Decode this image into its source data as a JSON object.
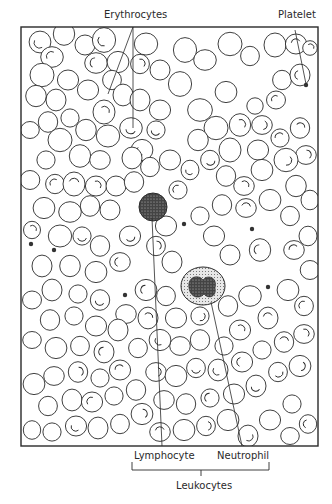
{
  "figure": {
    "type": "blood-smear-illustration",
    "labels": {
      "erythrocytes": "Erythrocytes",
      "platelet": "Platelet",
      "lymphocyte": "Lymphocyte",
      "neutrophil": "Neutrophil",
      "leukocytes": "Leukocytes"
    },
    "colors": {
      "ink": "#2a2a2a",
      "background": "#ffffff"
    },
    "frame": {
      "x": 21,
      "y": 27,
      "width": 297,
      "height": 419
    },
    "lymphocyte": {
      "cx": 153,
      "cy": 207,
      "r": 14
    },
    "neutrophil": {
      "cx": 203,
      "cy": 286,
      "rx": 22,
      "ry": 19
    },
    "platelets": [
      [
        306,
        85
      ],
      [
        268,
        287
      ],
      [
        125,
        295
      ],
      [
        184,
        224
      ],
      [
        31,
        244
      ],
      [
        54,
        250
      ],
      [
        252,
        229
      ]
    ],
    "rbcs": [
      [
        40,
        42,
        12,
        1
      ],
      [
        64,
        34,
        11,
        0
      ],
      [
        52,
        57,
        11,
        1
      ],
      [
        42,
        75,
        11,
        0
      ],
      [
        36,
        96,
        11,
        0
      ],
      [
        56,
        100,
        10,
        0
      ],
      [
        68,
        80,
        10,
        0
      ],
      [
        85,
        45,
        11,
        0
      ],
      [
        104,
        40,
        12,
        1
      ],
      [
        96,
        63,
        11,
        1
      ],
      [
        118,
        62,
        10,
        0
      ],
      [
        112,
        80,
        10,
        0
      ],
      [
        123,
        95,
        10,
        0
      ],
      [
        88,
        90,
        10,
        0
      ],
      [
        70,
        118,
        10,
        0
      ],
      [
        48,
        122,
        10,
        0
      ],
      [
        30,
        130,
        9,
        0
      ],
      [
        60,
        140,
        11,
        0
      ],
      [
        86,
        130,
        11,
        0
      ],
      [
        104,
        112,
        11,
        1
      ],
      [
        108,
        136,
        11,
        0
      ],
      [
        46,
        160,
        10,
        0
      ],
      [
        80,
        156,
        11,
        0
      ],
      [
        100,
        160,
        10,
        0
      ],
      [
        30,
        180,
        9,
        0
      ],
      [
        55,
        184,
        10,
        1
      ],
      [
        74,
        184,
        11,
        1
      ],
      [
        96,
        186,
        10,
        1
      ],
      [
        116,
        186,
        11,
        0
      ],
      [
        134,
        182,
        10,
        0
      ],
      [
        131,
        128,
        11,
        1
      ],
      [
        142,
        150,
        10,
        1
      ],
      [
        150,
        167,
        10,
        0
      ],
      [
        132,
        158,
        10,
        0
      ],
      [
        146,
        44,
        11,
        0
      ],
      [
        160,
        70,
        11,
        0
      ],
      [
        185,
        50,
        12,
        0
      ],
      [
        205,
        60,
        11,
        0
      ],
      [
        230,
        44,
        11,
        0
      ],
      [
        250,
        56,
        10,
        0
      ],
      [
        275,
        45,
        11,
        0
      ],
      [
        296,
        44,
        10,
        1
      ],
      [
        310,
        48,
        8,
        1
      ],
      [
        180,
        84,
        12,
        0
      ],
      [
        200,
        110,
        12,
        0
      ],
      [
        226,
        92,
        10,
        0
      ],
      [
        282,
        80,
        10,
        0
      ],
      [
        300,
        75,
        10,
        1
      ],
      [
        276,
        100,
        9,
        1
      ],
      [
        255,
        106,
        9,
        0
      ],
      [
        240,
        125,
        11,
        1
      ],
      [
        262,
        125,
        10,
        1
      ],
      [
        216,
        128,
        11,
        0
      ],
      [
        198,
        140,
        11,
        0
      ],
      [
        230,
        150,
        11,
        0
      ],
      [
        258,
        150,
        10,
        0
      ],
      [
        280,
        138,
        10,
        1
      ],
      [
        300,
        128,
        10,
        1
      ],
      [
        306,
        155,
        10,
        1
      ],
      [
        286,
        160,
        11,
        1
      ],
      [
        210,
        160,
        10,
        1
      ],
      [
        190,
        170,
        9,
        1
      ],
      [
        170,
        160,
        10,
        0
      ],
      [
        178,
        190,
        10,
        1
      ],
      [
        226,
        176,
        10,
        0
      ],
      [
        244,
        186,
        10,
        1
      ],
      [
        262,
        170,
        10,
        0
      ],
      [
        296,
        186,
        11,
        0
      ],
      [
        310,
        200,
        9,
        0
      ],
      [
        166,
        226,
        10,
        0
      ],
      [
        200,
        216,
        10,
        0
      ],
      [
        222,
        205,
        10,
        0
      ],
      [
        246,
        208,
        10,
        1
      ],
      [
        270,
        200,
        10,
        0
      ],
      [
        290,
        216,
        10,
        0
      ],
      [
        308,
        236,
        9,
        0
      ],
      [
        214,
        236,
        10,
        0
      ],
      [
        230,
        255,
        11,
        0
      ],
      [
        260,
        250,
        11,
        1
      ],
      [
        294,
        250,
        10,
        1
      ],
      [
        310,
        270,
        9,
        0
      ],
      [
        156,
        246,
        10,
        1
      ],
      [
        172,
        262,
        10,
        0
      ],
      [
        130,
        236,
        10,
        1
      ],
      [
        110,
        210,
        11,
        0
      ],
      [
        90,
        206,
        10,
        0
      ],
      [
        70,
        212,
        11,
        0
      ],
      [
        44,
        208,
        10,
        0
      ],
      [
        32,
        230,
        9,
        1
      ],
      [
        42,
        266,
        10,
        0
      ],
      [
        60,
        236,
        11,
        0
      ],
      [
        82,
        236,
        10,
        1
      ],
      [
        100,
        246,
        10,
        0
      ],
      [
        120,
        262,
        10,
        1
      ],
      [
        96,
        272,
        10,
        0
      ],
      [
        70,
        266,
        11,
        0
      ],
      [
        52,
        290,
        10,
        0
      ],
      [
        32,
        300,
        9,
        0
      ],
      [
        78,
        294,
        10,
        0
      ],
      [
        100,
        300,
        10,
        1
      ],
      [
        126,
        314,
        10,
        0
      ],
      [
        146,
        290,
        10,
        1
      ],
      [
        166,
        296,
        10,
        0
      ],
      [
        148,
        318,
        10,
        1
      ],
      [
        176,
        318,
        10,
        0
      ],
      [
        200,
        316,
        10,
        1
      ],
      [
        228,
        306,
        10,
        0
      ],
      [
        250,
        296,
        11,
        0
      ],
      [
        288,
        290,
        10,
        0
      ],
      [
        304,
        306,
        10,
        1
      ],
      [
        268,
        318,
        10,
        1
      ],
      [
        240,
        330,
        10,
        1
      ],
      [
        224,
        346,
        10,
        0
      ],
      [
        200,
        340,
        10,
        0
      ],
      [
        180,
        346,
        10,
        0
      ],
      [
        160,
        340,
        10,
        1
      ],
      [
        138,
        348,
        10,
        0
      ],
      [
        118,
        330,
        10,
        0
      ],
      [
        96,
        326,
        10,
        0
      ],
      [
        74,
        316,
        10,
        0
      ],
      [
        50,
        320,
        10,
        0
      ],
      [
        32,
        340,
        9,
        0
      ],
      [
        56,
        348,
        10,
        0
      ],
      [
        80,
        346,
        10,
        0
      ],
      [
        104,
        352,
        10,
        1
      ],
      [
        120,
        370,
        10,
        1
      ],
      [
        100,
        378,
        10,
        0
      ],
      [
        78,
        372,
        10,
        1
      ],
      [
        54,
        376,
        10,
        0
      ],
      [
        34,
        384,
        10,
        0
      ],
      [
        48,
        406,
        10,
        0
      ],
      [
        72,
        400,
        10,
        0
      ],
      [
        92,
        402,
        10,
        1
      ],
      [
        114,
        396,
        10,
        0
      ],
      [
        136,
        390,
        10,
        0
      ],
      [
        156,
        372,
        10,
        1
      ],
      [
        176,
        376,
        10,
        0
      ],
      [
        196,
        368,
        10,
        1
      ],
      [
        218,
        370,
        10,
        1
      ],
      [
        242,
        362,
        10,
        1
      ],
      [
        262,
        350,
        10,
        0
      ],
      [
        284,
        342,
        10,
        1
      ],
      [
        304,
        334,
        10,
        1
      ],
      [
        300,
        366,
        10,
        1
      ],
      [
        278,
        372,
        10,
        1
      ],
      [
        256,
        386,
        10,
        1
      ],
      [
        234,
        394,
        10,
        0
      ],
      [
        210,
        398,
        10,
        1
      ],
      [
        186,
        404,
        10,
        0
      ],
      [
        164,
        400,
        10,
        0
      ],
      [
        142,
        414,
        10,
        1
      ],
      [
        120,
        424,
        10,
        0
      ],
      [
        98,
        428,
        10,
        0
      ],
      [
        76,
        426,
        10,
        1
      ],
      [
        52,
        432,
        10,
        0
      ],
      [
        32,
        430,
        9,
        0
      ],
      [
        160,
        432,
        10,
        1
      ],
      [
        184,
        430,
        10,
        0
      ],
      [
        206,
        426,
        10,
        1
      ],
      [
        248,
        436,
        10,
        1
      ],
      [
        270,
        420,
        10,
        0
      ],
      [
        292,
        404,
        10,
        0
      ],
      [
        308,
        424,
        9,
        1
      ],
      [
        290,
        436,
        9,
        0
      ],
      [
        228,
        420,
        10,
        0
      ],
      [
        140,
        64,
        10,
        1
      ],
      [
        140,
        100,
        10,
        0
      ],
      [
        160,
        110,
        10,
        0
      ],
      [
        156,
        130,
        10,
        1
      ]
    ]
  }
}
